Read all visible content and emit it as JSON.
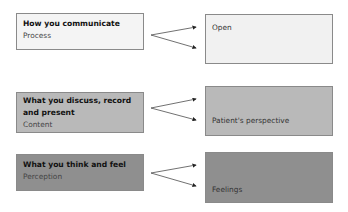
{
  "colors": {
    "row1_left": "#f4f4f4",
    "row1_right": "#f1f1f1",
    "row2": "#b9b9b9",
    "row3": "#8f8f8f",
    "border": "#8a8a8a",
    "arrow": "#222222"
  },
  "rows": [
    {
      "title": "How you communicate",
      "subtitle": "Process",
      "target": "Open"
    },
    {
      "title": "What you discuss, record and present",
      "subtitle": "Content",
      "target": "Patient's perspective"
    },
    {
      "title": "What you think and feel",
      "subtitle": "Perception",
      "target": "Feelings"
    }
  ]
}
